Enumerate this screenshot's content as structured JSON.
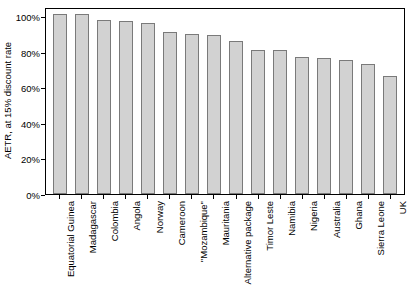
{
  "chart_data": {
    "type": "bar",
    "title": "",
    "xlabel": "",
    "ylabel": "AETR, at 15% discount rate",
    "ylim": [
      0,
      105
    ],
    "grid": false,
    "legend": "none",
    "ytick_labels": [
      "100%",
      "80%",
      "60%",
      "40%",
      "20%",
      "0%"
    ],
    "ytick_values": [
      100,
      80,
      60,
      40,
      20,
      0
    ],
    "categories": [
      "Equatorial Guinea",
      "Madagascar",
      "Colombia",
      "Angola",
      "Norway",
      "Cameroon",
      "\"Mozambique\"",
      "Mauritania",
      "Alternative package",
      "Timor Leste",
      "Namibia",
      "Nigeria",
      "Australia",
      "Ghana",
      "Sierra Leone",
      "UK"
    ],
    "values": [
      102,
      102,
      99,
      98,
      97,
      92,
      91,
      90,
      87,
      82,
      82,
      78,
      77,
      76,
      74,
      67
    ],
    "bar_fill_color": "#d2d2d2",
    "bar_border_color": "#7a7a7a",
    "axis_color": "#000000",
    "background_color": "#ffffff"
  }
}
